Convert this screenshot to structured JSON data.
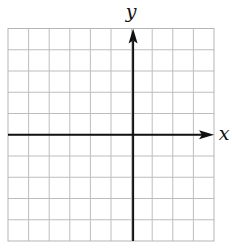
{
  "diagram": {
    "type": "coordinate-grid",
    "grid": {
      "columns": 10,
      "rows": 10,
      "left": 8,
      "top": 28.5,
      "right": 214,
      "bottom": 241,
      "line_color": "#bdbdbd",
      "border_color": "#b5b5b5"
    },
    "axes": {
      "color": "#111111",
      "x_axis": {
        "label": "x",
        "row_index_from_top": 5,
        "arrow": "right"
      },
      "y_axis": {
        "label": "y",
        "column_index_from_left": 6,
        "arrow": "up"
      }
    }
  }
}
